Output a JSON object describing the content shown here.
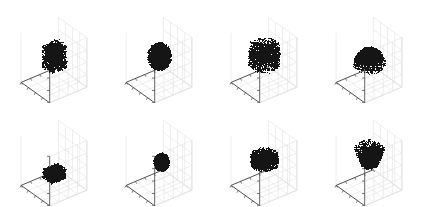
{
  "figure": {
    "title": "",
    "background_color": "#ffffff",
    "rows": 2,
    "cols": 4,
    "panel_count": 8,
    "shape_color": "#151515",
    "grid_color": "#e2e2e2",
    "axis_color": "#5a5a5a",
    "floor_edge_color": "#444444"
  },
  "chart_data": {
    "type": "scatter",
    "title": "",
    "xlabel": "",
    "ylabel": "",
    "zlabel": "",
    "grid": true,
    "legend_position": "none",
    "xlim": [
      0,
      1
    ],
    "ylim": [
      0,
      1
    ],
    "zlim": [
      0,
      1
    ],
    "projection": "3d",
    "tick_labels": {
      "x": [],
      "y": [],
      "z": []
    },
    "ticks_per_axis": 5,
    "panels": [
      {
        "index": 0,
        "row": 0,
        "col": 0,
        "label": "",
        "shape": "cuboid",
        "shape_name": "box",
        "center": [
          0.5,
          0.5,
          0.58
        ],
        "size": [
          0.42,
          0.34,
          0.46
        ],
        "point_count": 2000,
        "color": "#151515"
      },
      {
        "index": 1,
        "row": 0,
        "col": 1,
        "label": "",
        "shape": "sphere",
        "shape_name": "sphere",
        "center": [
          0.5,
          0.5,
          0.58
        ],
        "radius": 0.26,
        "point_count": 2000,
        "color": "#151515"
      },
      {
        "index": 2,
        "row": 0,
        "col": 2,
        "label": "",
        "shape": "cylinder",
        "shape_name": "cylinder",
        "center": [
          0.5,
          0.5,
          0.6
        ],
        "radius": 0.34,
        "height": 0.4,
        "point_count": 2000,
        "color": "#151515"
      },
      {
        "index": 3,
        "row": 0,
        "col": 3,
        "label": "",
        "shape": "dome",
        "shape_name": "cone",
        "center": [
          0.5,
          0.5,
          0.56
        ],
        "radius": 0.34,
        "height": 0.34,
        "point_count": 2000,
        "color": "#151515"
      },
      {
        "index": 4,
        "row": 1,
        "col": 0,
        "label": "",
        "shape": "cuboid",
        "shape_name": "slab",
        "center": [
          0.5,
          0.5,
          0.3
        ],
        "size": [
          0.4,
          0.32,
          0.2
        ],
        "point_count": 2000,
        "color": "#151515"
      },
      {
        "index": 5,
        "row": 1,
        "col": 1,
        "label": "",
        "shape": "sphere",
        "shape_name": "sphere",
        "center": [
          0.54,
          0.52,
          0.52
        ],
        "radius": 0.17,
        "point_count": 2000,
        "color": "#151515"
      },
      {
        "index": 6,
        "row": 1,
        "col": 2,
        "label": "",
        "shape": "cylinder",
        "shape_name": "disc",
        "center": [
          0.5,
          0.5,
          0.58
        ],
        "radius": 0.3,
        "height": 0.2,
        "point_count": 2000,
        "color": "#151515"
      },
      {
        "index": 7,
        "row": 1,
        "col": 3,
        "label": "",
        "shape": "frustum",
        "shape_name": "inverted-cone",
        "center": [
          0.5,
          0.5,
          0.64
        ],
        "top_radius": 0.34,
        "bottom_radius": 0.17,
        "height": 0.36,
        "point_count": 2000,
        "color": "#151515"
      }
    ]
  }
}
